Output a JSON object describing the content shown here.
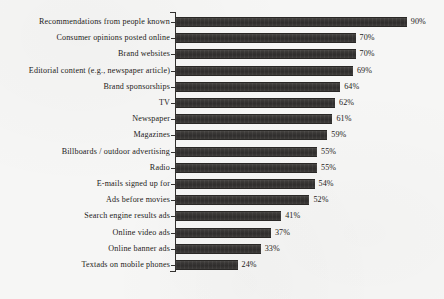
{
  "chart_data": {
    "type": "bar",
    "orientation": "horizontal",
    "title": "",
    "subtitle": "",
    "xlabel": "",
    "ylabel": "",
    "xlim": [
      0,
      100
    ],
    "grid": false,
    "legend": null,
    "value_suffix": "%",
    "bar_color": "#332f2d",
    "background_color": "#f6f6f5",
    "categories": [
      "Recommendations from people known",
      "Consumer opinions posted online",
      "Brand websites",
      "Editorial content (e.g., newspaper article)",
      "Brand sponsorships",
      "TV",
      "Newspaper",
      "Magazines",
      "Billboards / outdoor advertising",
      "Radio",
      "E-mails signed up for",
      "Ads before movies",
      "Search engine results ads",
      "Online video ads",
      "Online banner ads",
      "Textads on mobile phones"
    ],
    "values": [
      90,
      70,
      70,
      69,
      64,
      62,
      61,
      59,
      55,
      55,
      54,
      52,
      41,
      37,
      33,
      24
    ],
    "value_labels": [
      "90%",
      "70%",
      "70%",
      "69%",
      "64%",
      "62%",
      "61%",
      "59%",
      "55%",
      "55%",
      "54%",
      "52%",
      "41%",
      "37%",
      "33%",
      "24%"
    ]
  }
}
